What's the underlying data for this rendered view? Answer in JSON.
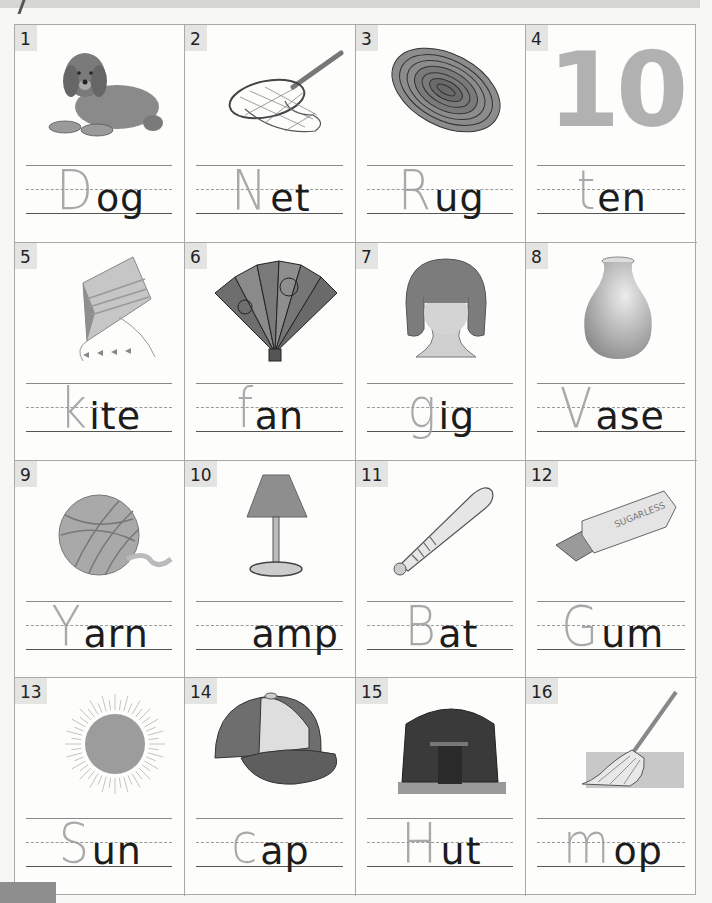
{
  "worksheet": {
    "cells": [
      {
        "number": "1",
        "picture": "dog",
        "written_letter": "D",
        "printed_ending": "og"
      },
      {
        "number": "2",
        "picture": "net",
        "written_letter": "N",
        "printed_ending": "et"
      },
      {
        "number": "3",
        "picture": "rug",
        "written_letter": "R",
        "printed_ending": "ug"
      },
      {
        "number": "4",
        "picture": "ten",
        "picture_text": "10",
        "written_letter": "t",
        "printed_ending": "en"
      },
      {
        "number": "5",
        "picture": "kite",
        "written_letter": "k",
        "printed_ending": "ite"
      },
      {
        "number": "6",
        "picture": "fan",
        "written_letter": "f",
        "printed_ending": "an"
      },
      {
        "number": "7",
        "picture": "wig",
        "written_letter": "g",
        "printed_ending": "ig"
      },
      {
        "number": "8",
        "picture": "vase",
        "written_letter": "V",
        "printed_ending": "ase"
      },
      {
        "number": "9",
        "picture": "yarn",
        "written_letter": "Y",
        "printed_ending": "arn"
      },
      {
        "number": "10",
        "picture": "lamp",
        "written_letter": "",
        "printed_ending": "amp"
      },
      {
        "number": "11",
        "picture": "bat",
        "written_letter": "B",
        "printed_ending": "at"
      },
      {
        "number": "12",
        "picture": "gum",
        "picture_text": "SUGARLESS",
        "written_letter": "G",
        "printed_ending": "um"
      },
      {
        "number": "13",
        "picture": "sun",
        "written_letter": "S",
        "printed_ending": "un"
      },
      {
        "number": "14",
        "picture": "cap",
        "written_letter": "c",
        "printed_ending": "ap"
      },
      {
        "number": "15",
        "picture": "hut",
        "written_letter": "H",
        "printed_ending": "ut"
      },
      {
        "number": "16",
        "picture": "mop",
        "written_letter": "m",
        "printed_ending": "op"
      }
    ]
  },
  "colors": {
    "ink_printed": "#1c1c1c",
    "ink_handwritten": "#9b9b9b",
    "grid_border": "#a9a9a9",
    "number_tab": "#e4e4e2",
    "picture_gray": "#8f8f8f"
  }
}
